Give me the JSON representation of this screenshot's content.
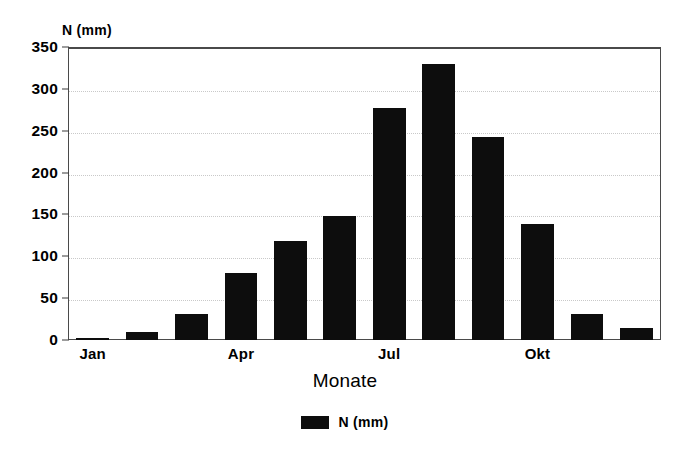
{
  "chart_data": {
    "type": "bar",
    "title": "",
    "categories": [
      "Jan",
      "Feb",
      "Mrz",
      "Apr",
      "Mai",
      "Jun",
      "Jul",
      "Aug",
      "Sep",
      "Okt",
      "Nov",
      "Dez"
    ],
    "values": [
      3,
      10,
      31,
      80,
      118,
      148,
      277,
      330,
      243,
      138,
      31,
      14
    ],
    "series": [
      {
        "name": "N (mm)",
        "values": [
          3,
          10,
          31,
          80,
          118,
          148,
          277,
          330,
          243,
          138,
          31,
          14
        ]
      }
    ],
    "xlabel": "Monate",
    "ylabel": "N (mm)",
    "ylim": [
      0,
      350
    ],
    "yticks": [
      0,
      50,
      100,
      150,
      200,
      250,
      300,
      350
    ],
    "ytick_labels": [
      "0",
      "50",
      "100",
      "150",
      "200",
      "250",
      "300",
      "350"
    ],
    "xtick_labels": [
      "Jan",
      "Apr",
      "Jul",
      "Okt"
    ],
    "xtick_indices": [
      0,
      3,
      6,
      9
    ],
    "grid": true,
    "legend": {
      "position": "bottom",
      "entries": [
        {
          "label": "N (mm)",
          "color": "#0d0d0d"
        }
      ]
    },
    "bar_color": "#0d0d0d",
    "frame_color": "#4a4a4a",
    "grid_color": "#c9c9c9",
    "background": "#ffffff"
  }
}
